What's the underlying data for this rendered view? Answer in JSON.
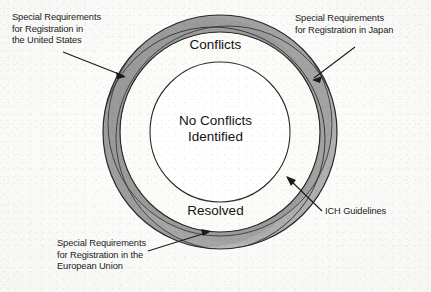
{
  "figure": {
    "center_label": "No Conflicts\nIdentified",
    "ring_labels": {
      "top": "Conflicts",
      "bottom": "Resolved"
    },
    "callouts": [
      {
        "id": "us",
        "text": "Special Requirements\nfor Registration in\nthe United States",
        "position": "top-left"
      },
      {
        "id": "japan",
        "text": "Special Requirements\nfor Registration in Japan",
        "position": "top-right"
      },
      {
        "id": "eu",
        "text": "Special Requirements\nfor Registration in the\nEuropean Union",
        "position": "bottom-left"
      },
      {
        "id": "ich",
        "text": "ICH Guidelines",
        "position": "right"
      }
    ],
    "colors": {
      "background": "#fcfcfa",
      "outer_band": "#b2b2b2",
      "outer_band_overlap": "#949494",
      "outer_band_light": "#c2c2c2",
      "inner_ring": "#fbfbf8",
      "stroke": "#2b2b2b",
      "text": "#141414"
    },
    "geometry": {
      "center_x": 220,
      "center_y": 132,
      "outer_radius": 117,
      "band_inner_radius": 100,
      "white_ring_inner_radius": 70
    }
  }
}
